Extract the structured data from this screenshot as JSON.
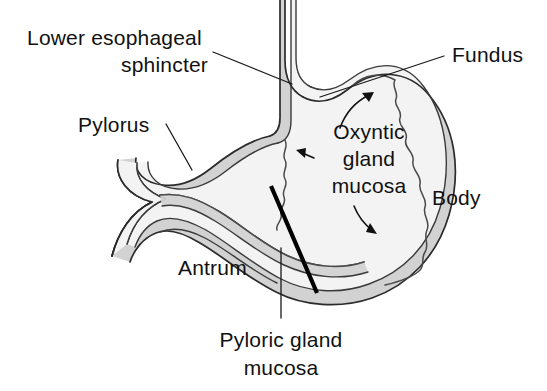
{
  "figure": {
    "background_color": "#ffffff",
    "line_color": "#2b2b2b",
    "lumen_fill": "#f2f2f2",
    "wall_fill": "#d0d0d0",
    "divider_color": "#000000"
  },
  "labels": {
    "lower_esophageal_sphincter_line1": "Lower esophageal",
    "lower_esophageal_sphincter_line2": "sphincter",
    "pylorus": "Pylorus",
    "fundus": "Fundus",
    "oxyntic_line1": "Oxyntic",
    "oxyntic_line2": "gland",
    "oxyntic_line3": "mucosa",
    "body": "Body",
    "antrum": "Antrum",
    "pyloric_gland_line1": "Pyloric gland",
    "pyloric_gland_line2": "mucosa"
  },
  "regions": [
    {
      "name": "fundus",
      "description": "Upper dome of the stomach"
    },
    {
      "name": "body",
      "description": "Main central region of the stomach"
    },
    {
      "name": "antrum",
      "description": "Lower narrowed region before the pylorus"
    },
    {
      "name": "pylorus",
      "description": "Outlet sphincter to the duodenum"
    },
    {
      "name": "lower-esophageal-sphincter",
      "description": "Junction of esophagus and stomach"
    }
  ],
  "mucosa_types": [
    {
      "name": "oxyntic-gland-mucosa",
      "covers": "fundus and body"
    },
    {
      "name": "pyloric-gland-mucosa",
      "covers": "antrum and pylorus"
    }
  ]
}
